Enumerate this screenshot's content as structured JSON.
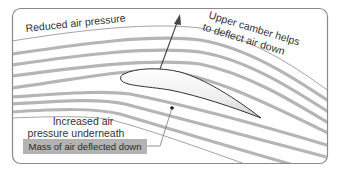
{
  "diagram": {
    "labels": {
      "top_left": "Reduced air pressure",
      "top_right_line1": "Upper camber helps",
      "top_right_line2": "to deflect air down",
      "bottom_line1": "Increased air",
      "bottom_line2": "pressure underneath",
      "box": "Mass of air deflected down"
    },
    "elements": {
      "airfoil": "wing cross-section (airfoil)",
      "lift_arrow": "lift arrow pointing up",
      "streamlines": "airflow streamlines deflected downward behind wing"
    },
    "colors": {
      "frame": "#8a8a8a",
      "streamline": "#b5b5b5",
      "streamline_thin": "#9a9a9a",
      "airfoil_fill": "#f2f2f2",
      "airfoil_stroke": "#333333",
      "arrow": "#444444",
      "box_fill": "#b3b3b3",
      "text": "#333333"
    }
  }
}
